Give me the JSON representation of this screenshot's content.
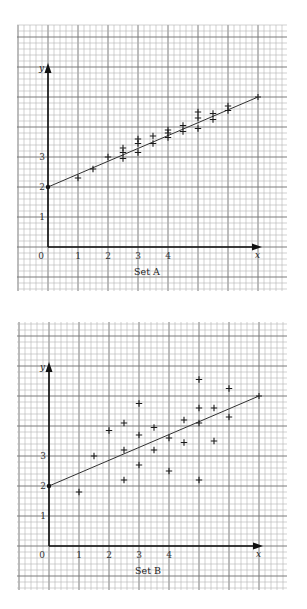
{
  "chart_data": [
    {
      "type": "scatter",
      "title": "Set A",
      "xlabel": "x",
      "ylabel": "y",
      "x_ticks": [
        "0",
        "1",
        "2",
        "3",
        "4"
      ],
      "y_ticks": [
        "1",
        "2",
        "3"
      ],
      "xlim": [
        0,
        7
      ],
      "ylim": [
        0,
        6
      ],
      "grid": true,
      "marker": "+",
      "points": [
        [
          1,
          2.3
        ],
        [
          1.5,
          2.6
        ],
        [
          2,
          3.0
        ],
        [
          2.5,
          3.3
        ],
        [
          2.5,
          3.15
        ],
        [
          2.5,
          2.95
        ],
        [
          3,
          3.6
        ],
        [
          3,
          3.45
        ],
        [
          3,
          3.15
        ],
        [
          3.5,
          3.7
        ],
        [
          3.5,
          3.45
        ],
        [
          4,
          3.9
        ],
        [
          4,
          3.8
        ],
        [
          4,
          3.65
        ],
        [
          4.5,
          4.05
        ],
        [
          4.5,
          3.85
        ],
        [
          5,
          4.5
        ],
        [
          5,
          4.3
        ],
        [
          5,
          3.95
        ],
        [
          5.5,
          4.45
        ],
        [
          5.5,
          4.25
        ],
        [
          6,
          4.7
        ],
        [
          6,
          4.55
        ]
      ],
      "fit_line": {
        "from": [
          0,
          2
        ],
        "to": [
          7,
          5
        ]
      }
    },
    {
      "type": "scatter",
      "title": "Set B",
      "xlabel": "x",
      "ylabel": "y",
      "x_ticks": [
        "0",
        "1",
        "2",
        "3",
        "4"
      ],
      "y_ticks": [
        "1",
        "2",
        "3"
      ],
      "xlim": [
        0,
        7
      ],
      "ylim": [
        0,
        6
      ],
      "grid": true,
      "marker": "+",
      "points": [
        [
          1,
          1.8
        ],
        [
          1.5,
          3.0
        ],
        [
          2,
          3.85
        ],
        [
          2.5,
          4.1
        ],
        [
          2.5,
          3.2
        ],
        [
          2.5,
          2.2
        ],
        [
          3,
          4.75
        ],
        [
          3,
          3.7
        ],
        [
          3,
          2.7
        ],
        [
          3.5,
          3.95
        ],
        [
          3.5,
          3.2
        ],
        [
          4,
          3.6
        ],
        [
          4,
          2.5
        ],
        [
          4.5,
          4.2
        ],
        [
          4.5,
          3.45
        ],
        [
          5,
          5.55
        ],
        [
          5,
          4.6
        ],
        [
          5,
          4.1
        ],
        [
          5,
          2.2
        ],
        [
          5.5,
          4.6
        ],
        [
          5.5,
          3.5
        ],
        [
          6,
          5.25
        ],
        [
          6,
          4.3
        ]
      ],
      "fit_line": {
        "from": [
          0,
          2
        ],
        "to": [
          7,
          5
        ]
      }
    }
  ],
  "charts": {
    "a": {
      "label": "Set A",
      "x_axis_name": "x",
      "y_axis_name": "y"
    },
    "b": {
      "label": "Set B",
      "x_axis_name": "x",
      "y_axis_name": "y"
    }
  }
}
